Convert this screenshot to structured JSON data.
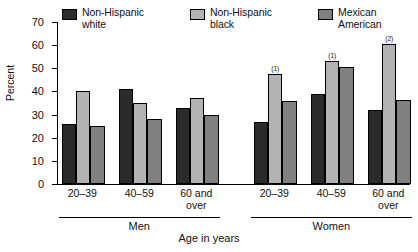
{
  "chart_data": {
    "type": "bar",
    "title": "",
    "xlabel": "Age in years",
    "ylabel": "Percent",
    "ylim": [
      0,
      70
    ],
    "yticks": [
      0,
      10,
      20,
      30,
      40,
      50,
      60,
      70
    ],
    "grid": false,
    "legend_position": "top",
    "categories": [
      "20–39",
      "40–59",
      "60 and\nover",
      "20–39",
      "40–59",
      "60 and\nover"
    ],
    "group_labels": [
      "Men",
      "Women"
    ],
    "series": [
      {
        "name": "Non-Hispanic\nwhite",
        "color": "#2b2b2b",
        "values": [
          26,
          41,
          33,
          27,
          39,
          32
        ]
      },
      {
        "name": "Non-Hispanic\nblack",
        "color": "#b3b3b3",
        "values": [
          40,
          35,
          37,
          47.5,
          53,
          60.5
        ]
      },
      {
        "name": "Mexican American",
        "color": "#808080",
        "values": [
          25,
          28,
          30,
          36,
          50.5,
          36.5
        ]
      }
    ],
    "annotations": [
      {
        "text": "(1)",
        "series": 1,
        "category": 3
      },
      {
        "text": "(1)",
        "series": 1,
        "category": 4
      },
      {
        "text": "(2)",
        "series": 1,
        "category": 5
      }
    ]
  }
}
